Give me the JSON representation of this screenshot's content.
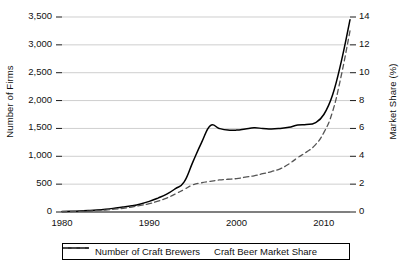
{
  "chart_data": {
    "type": "line",
    "title": "",
    "xlabel": "",
    "ylabel": "Number of Firms",
    "y2label": "Market Share (%)",
    "xlim": [
      1980,
      2013
    ],
    "ylim": [
      0,
      3500
    ],
    "y2lim": [
      0,
      14
    ],
    "grid": true,
    "legend_position": "bottom",
    "x_ticks": [
      "1980",
      "1990",
      "2000",
      "2010"
    ],
    "x_tick_values": [
      1980,
      1990,
      2000,
      2010
    ],
    "y_ticks_left": [
      "0",
      "500",
      "1,000",
      "1,500",
      "2,000",
      "2,500",
      "3,000",
      "3,500"
    ],
    "y_tick_values_left": [
      0,
      500,
      1000,
      1500,
      2000,
      2500,
      3000,
      3500
    ],
    "y_ticks_right": [
      "0",
      "2",
      "4",
      "6",
      "8",
      "10",
      "12",
      "14"
    ],
    "y_tick_values_right": [
      0,
      2,
      4,
      6,
      8,
      10,
      12,
      14
    ],
    "x": [
      1980,
      1981,
      1982,
      1983,
      1984,
      1985,
      1986,
      1987,
      1988,
      1989,
      1990,
      1991,
      1992,
      1993,
      1994,
      1995,
      1996,
      1997,
      1998,
      1999,
      2000,
      2001,
      2002,
      2003,
      2004,
      2005,
      2006,
      2007,
      2008,
      2009,
      2010,
      2011,
      2012,
      2013
    ],
    "series": [
      {
        "name": "Number of Craft Brewers",
        "axis": "left",
        "style": "solid",
        "color": "#000000",
        "values": [
          8,
          12,
          18,
          26,
          36,
          50,
          68,
          88,
          112,
          145,
          190,
          250,
          320,
          420,
          540,
          900,
          1250,
          1550,
          1500,
          1470,
          1470,
          1490,
          1510,
          1500,
          1490,
          1500,
          1520,
          1560,
          1570,
          1600,
          1750,
          2100,
          2700,
          3450
        ]
      },
      {
        "name": "Craft Beer Market Share",
        "axis": "right",
        "style": "dashed",
        "color": "#555555",
        "values": [
          0.02,
          0.03,
          0.05,
          0.07,
          0.1,
          0.14,
          0.2,
          0.27,
          0.36,
          0.47,
          0.6,
          0.78,
          1.0,
          1.3,
          1.62,
          1.95,
          2.1,
          2.2,
          2.3,
          2.35,
          2.4,
          2.5,
          2.6,
          2.75,
          2.9,
          3.1,
          3.45,
          3.9,
          4.3,
          4.8,
          5.7,
          7.2,
          9.8,
          13.0
        ]
      }
    ]
  },
  "legend": {
    "items": [
      {
        "label": "Number of Craft Brewers",
        "style": "solid"
      },
      {
        "label": "Craft Beer Market Share",
        "style": "dashed"
      }
    ]
  }
}
